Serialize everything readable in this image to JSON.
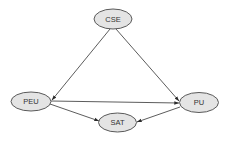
{
  "diagram": {
    "type": "directed-graph",
    "colors": {
      "node_fill": "#e4e4e4",
      "node_stroke": "#5a5a5a",
      "edge": "#4a4a4a",
      "text": "#333333",
      "background": "#ffffff"
    },
    "nodes": [
      {
        "id": "CSE",
        "label": "CSE",
        "cx": 113,
        "cy": 19,
        "rx": 19,
        "ry": 10
      },
      {
        "id": "PEU",
        "label": "PEU",
        "cx": 31,
        "cy": 101.5,
        "rx": 20,
        "ry": 9.5
      },
      {
        "id": "PU",
        "label": "PU",
        "cx": 199,
        "cy": 102.5,
        "rx": 19.5,
        "ry": 10
      },
      {
        "id": "SAT",
        "label": "SAT",
        "cx": 117.5,
        "cy": 122.5,
        "rx": 19,
        "ry": 9.5
      }
    ],
    "edges": [
      {
        "from": "CSE",
        "to": "PEU",
        "x1": 110,
        "y1": 29,
        "x2": 52,
        "y2": 100
      },
      {
        "from": "CSE",
        "to": "PU",
        "x1": 116,
        "y1": 29,
        "x2": 179,
        "y2": 101
      },
      {
        "from": "PEU",
        "to": "PU",
        "x1": 51,
        "y1": 101,
        "x2": 179,
        "y2": 103
      },
      {
        "from": "PEU",
        "to": "SAT",
        "x1": 50,
        "y1": 104,
        "x2": 99,
        "y2": 121
      },
      {
        "from": "PU",
        "to": "SAT",
        "x1": 180,
        "y1": 107,
        "x2": 137,
        "y2": 122
      }
    ]
  }
}
